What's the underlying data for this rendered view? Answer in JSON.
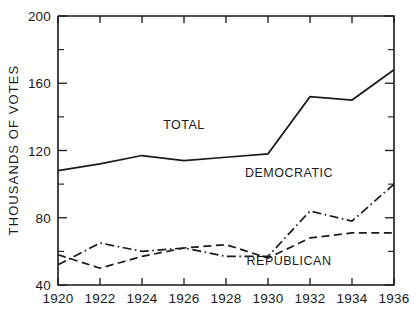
{
  "chart_data": {
    "type": "line",
    "title": "",
    "xlabel": "",
    "ylabel": "THOUSANDS OF VOTES",
    "x": [
      1920,
      1922,
      1924,
      1926,
      1928,
      1930,
      1932,
      1934,
      1936
    ],
    "xtick_labels": [
      "1920",
      "1922",
      "1924",
      "1926",
      "1928",
      "1930",
      "1932",
      "1934",
      "1936"
    ],
    "ytick_labels": [
      "40",
      "80",
      "120",
      "160",
      "200"
    ],
    "yticks": [
      40,
      80,
      120,
      160,
      200
    ],
    "yminor_ticks": [
      60,
      100,
      140,
      180
    ],
    "xlim": [
      1920,
      1936
    ],
    "ylim": [
      40,
      200
    ],
    "grid": false,
    "legend_position": "inline-annotations",
    "series": [
      {
        "name": "TOTAL",
        "style": "solid",
        "label_x": 1926,
        "label_y": 133,
        "values": [
          108,
          112,
          117,
          114,
          116,
          118,
          152,
          150,
          168
        ]
      },
      {
        "name": "DEMOCRATIC",
        "style": "dash-dot",
        "label_x": 1931,
        "label_y": 104,
        "values": [
          52,
          65,
          60,
          62,
          57,
          57,
          84,
          78,
          100
        ]
      },
      {
        "name": "REPUBLICAN",
        "style": "dashed",
        "label_x": 1931,
        "label_y": 52,
        "values": [
          58,
          50,
          57,
          62,
          64,
          56,
          68,
          71,
          71
        ]
      }
    ]
  }
}
